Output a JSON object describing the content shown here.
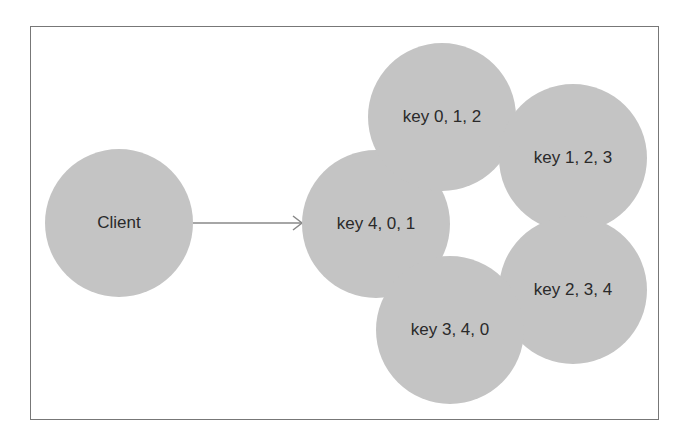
{
  "diagram": {
    "type": "consistent-hashing-replication",
    "nodes": [
      {
        "id": "client",
        "label": "Client",
        "cx": 119,
        "cy": 223,
        "r": 74
      },
      {
        "id": "n401",
        "label": "key 4, 0, 1",
        "cx": 376,
        "cy": 224,
        "r": 74
      },
      {
        "id": "n012",
        "label": "key 0, 1, 2",
        "cx": 442,
        "cy": 117,
        "r": 74
      },
      {
        "id": "n123",
        "label": "key 1, 2, 3",
        "cx": 573,
        "cy": 158,
        "r": 74
      },
      {
        "id": "n234",
        "label": "key 2, 3, 4",
        "cx": 573,
        "cy": 290,
        "r": 74
      },
      {
        "id": "n340",
        "label": "key 3, 4, 0",
        "cx": 450,
        "cy": 330,
        "r": 74
      }
    ],
    "edges": [
      {
        "from": "client",
        "to": "n401",
        "x1": 193,
        "y1": 223,
        "x2": 302,
        "y2": 223,
        "arrow": true
      }
    ],
    "colors": {
      "node_fill": "#c4c4c4",
      "edge": "#888888",
      "frame": "#777777",
      "text": "#2a2a2a"
    }
  }
}
